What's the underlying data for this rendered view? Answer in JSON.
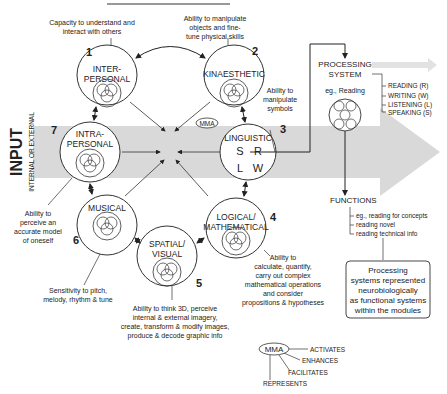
{
  "input_arrow": {
    "title": "INPUT",
    "subtitle": "INTERNAL OR EXTERNAL",
    "color": "#d9d9d9"
  },
  "modules": [
    {
      "number": "1",
      "label_lines": [
        "INTER-",
        "PERSONAL"
      ],
      "caption_lines": [
        "Capacity to understand and",
        "interact with others"
      ]
    },
    {
      "number": "2",
      "label_lines": [
        "KINAESTHETIC"
      ],
      "caption_lines": [
        "Ability to manipulate",
        "objects and fine-",
        "tune physical skills"
      ]
    },
    {
      "number": "3",
      "label_lines": [
        "LINGUISTIC"
      ],
      "letters": [
        "S",
        "R",
        "L",
        "W"
      ],
      "caption_lines": [
        "Ability to",
        "manipulate",
        "symbols"
      ]
    },
    {
      "number": "4",
      "label_lines": [
        "LOGICAL/",
        "MATHEMATICAL"
      ],
      "caption_lines": [
        "Ability to",
        "calculate, quantify,",
        "carry out complex",
        "mathematical operations",
        "and consider",
        "propositions & hypotheses"
      ]
    },
    {
      "number": "5",
      "label_lines": [
        "SPATIAL/",
        "VISUAL"
      ],
      "caption_lines": [
        "Ability to think 3D, perceive",
        "internal & external imagery,",
        "create, transform & modify images,",
        "produce & decode graphic info"
      ]
    },
    {
      "number": "6",
      "label_lines": [
        "MUSICAL"
      ],
      "caption_lines": [
        "Sensitivity to pitch,",
        "melody, rhythm & tune"
      ]
    },
    {
      "number": "7",
      "label_lines": [
        "INTRA-",
        "PERSONAL"
      ],
      "caption_lines": [
        "Ability to",
        "perceive an",
        "accurate model",
        "of oneself"
      ]
    }
  ],
  "mma_badge": "MMA",
  "processing": {
    "title_lines": [
      "PROCESSING",
      "SYSTEM"
    ],
    "example": "eg., Reading",
    "items": [
      "READING (R)",
      "WRITING (W)",
      "LISTENING (L)",
      "SPEAKING (S)"
    ]
  },
  "functions": {
    "title": "FUNCTIONS",
    "items": [
      "eg., reading for concepts",
      "reading novel",
      "reading technical info"
    ]
  },
  "note_box": {
    "lines": [
      "Processing",
      "systems represented",
      "neurobiologically",
      "as functional systems",
      "within the modules"
    ]
  },
  "legend": {
    "badge": "MMA",
    "items": [
      "ACTIVATES",
      "ENHANCES",
      "FACILITATES",
      "REPRESENTS"
    ]
  }
}
